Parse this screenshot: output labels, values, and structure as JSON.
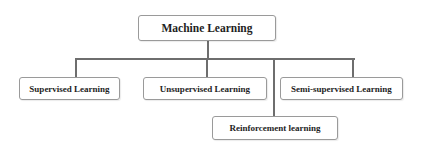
{
  "diagram": {
    "type": "tree",
    "root": {
      "label": "Machine Learning"
    },
    "children": [
      {
        "label": "Supervised Learning"
      },
      {
        "label": "Unsupervised Learning"
      },
      {
        "label": "Semi-supervised Learning"
      },
      {
        "label": "Reinforcement learning"
      }
    ],
    "colors": {
      "connector": "#6e6e6e",
      "box_border": "#9a9a9a",
      "text": "#1e1e1e",
      "background": "#ffffff"
    }
  }
}
